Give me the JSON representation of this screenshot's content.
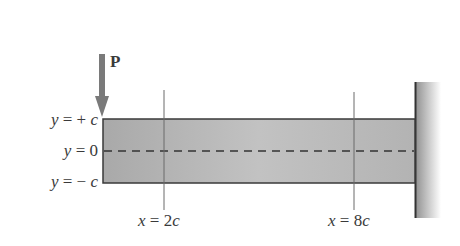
{
  "diagram": {
    "type": "cantilever-beam",
    "load": {
      "label": "P",
      "direction": "down",
      "position": "free-end-top"
    },
    "y_labels": [
      {
        "var": "y",
        "eq": "=",
        "value": "+ c",
        "text": "y = + c"
      },
      {
        "var": "y",
        "eq": "=",
        "value": "0",
        "text": "y = 0"
      },
      {
        "var": "y",
        "eq": "=",
        "value": "− c",
        "text": "y = − c"
      }
    ],
    "x_sections": [
      {
        "var": "x",
        "eq": "=",
        "value": "2c",
        "text": "x = 2c"
      },
      {
        "var": "x",
        "eq": "=",
        "value": "8c",
        "text": "x = 8c"
      }
    ],
    "support": "fixed-wall-right",
    "neutral_axis": "dashed",
    "colors": {
      "beam_fill": "#b5b5b5",
      "beam_outline": "#3a3a3a",
      "arrow": "#7a7a7a",
      "wall_dark": "#9a9a9a",
      "line": "#6a6a6a"
    }
  }
}
